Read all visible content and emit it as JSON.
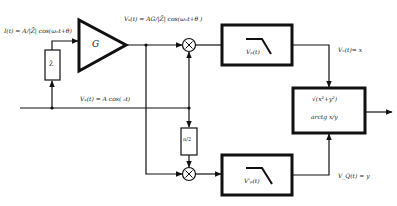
{
  "diagram": {
    "type": "block-diagram",
    "title": "",
    "blocks": {
      "amplifier": {
        "label": "G"
      },
      "impedance": {
        "label": "Z̄"
      },
      "phase_shift": {
        "label": "π/2"
      },
      "lpf_top": {
        "label": "Vₚ(t)"
      },
      "lpf_bottom": {
        "label": "V'ₚ(t)"
      },
      "output_block": {
        "line1": "√(x²+y²)",
        "line2": "arctg x/y"
      }
    },
    "signals": {
      "input_current": "I(t) = A/|Z̄| cos(ωₒt+θ)",
      "amp_output": "Vₛ(t) = AG/|Z̄| cos(ωₒt+θ )",
      "reference": "Vₑ(t) = A cos( ₒt)",
      "in_phase": "Vₒ(t)= x",
      "quadrature": "V_Q(t) = y"
    },
    "mixers": [
      {
        "symbol": "×"
      },
      {
        "symbol": "×"
      }
    ]
  }
}
